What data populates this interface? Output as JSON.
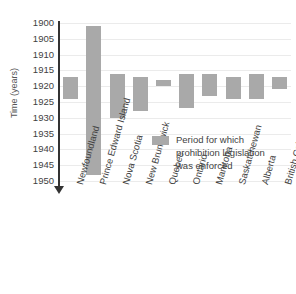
{
  "chart_data": {
    "type": "bar",
    "orientation": "vertical-range",
    "title": "",
    "xlabel": "",
    "ylabel": "Time (years)",
    "ylim": [
      1900,
      1950
    ],
    "y_inverted": true,
    "grid": true,
    "ytick_step": 5,
    "yticks": [
      "1900",
      "1905",
      "1910",
      "1915",
      "1920",
      "1925",
      "1930",
      "1935",
      "1940",
      "1945",
      "1950"
    ],
    "categories": [
      "Newfoundland",
      "Prince Edward Island",
      "Nova Scotia",
      "New Brunswick",
      "Quebec",
      "Ontario",
      "Manitoba",
      "Saskatchewan",
      "Alberta",
      "British Columbia"
    ],
    "series": [
      {
        "name": "Period for which prohibition legislation was enforced",
        "color": "#a9a9a9",
        "ranges": [
          {
            "category": "Newfoundland",
            "start": 1917,
            "end": 1924
          },
          {
            "category": "Prince Edward Island",
            "start": 1901,
            "end": 1948
          },
          {
            "category": "Nova Scotia",
            "start": 1916,
            "end": 1930
          },
          {
            "category": "New Brunswick",
            "start": 1917,
            "end": 1928
          },
          {
            "category": "Quebec",
            "start": 1918,
            "end": 1920
          },
          {
            "category": "Ontario",
            "start": 1916,
            "end": 1927
          },
          {
            "category": "Manitoba",
            "start": 1916,
            "end": 1923
          },
          {
            "category": "Saskatchewan",
            "start": 1917,
            "end": 1924
          },
          {
            "category": "Alberta",
            "start": 1916,
            "end": 1924
          },
          {
            "category": "British Columbia",
            "start": 1917,
            "end": 1921
          }
        ]
      }
    ],
    "legend": {
      "position": "inside-right",
      "entries": [
        {
          "color": "#a9a9a9",
          "lines": [
            "Period for which",
            "prohibition legislation",
            "was enforced"
          ]
        }
      ]
    },
    "axis_style": {
      "y_axis_arrow": "down",
      "axis_color": "#333333",
      "grid_color": "#ebebeb"
    }
  }
}
